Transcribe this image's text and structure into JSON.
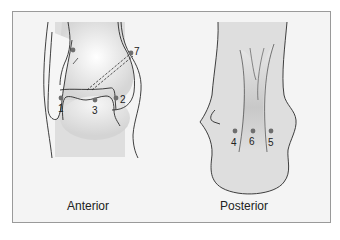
{
  "figure": {
    "views": [
      {
        "id": "anterior",
        "caption": "Anterior",
        "points": [
          {
            "label": "1",
            "x": 61,
            "y": 98
          },
          {
            "label": "2",
            "x": 116,
            "y": 98
          },
          {
            "label": "3",
            "x": 95,
            "y": 100
          },
          {
            "label": "7",
            "x": 131,
            "y": 53
          }
        ],
        "unlabeled_points": [
          {
            "x": 73,
            "y": 50
          }
        ]
      },
      {
        "id": "posterior",
        "caption": "Posterior",
        "points": [
          {
            "label": "4",
            "x": 235,
            "y": 131
          },
          {
            "label": "6",
            "x": 253,
            "y": 131
          },
          {
            "label": "5",
            "x": 271,
            "y": 131
          }
        ]
      }
    ],
    "colors": {
      "frame_border": "#9a9a9a",
      "background": "#f4f4f4",
      "bone_shade": "#dcdcdc",
      "outline": "#2a2a2a",
      "point": "#6e6e6e"
    }
  }
}
